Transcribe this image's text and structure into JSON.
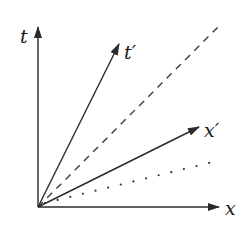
{
  "diagram": {
    "title": "",
    "type": "spacetime-diagram",
    "colors": {
      "line": "#2a2a2a",
      "background": "#ffffff"
    },
    "origin": {
      "x": 38,
      "y": 207
    },
    "axes": {
      "t": {
        "label": "t",
        "end": {
          "x": 38,
          "y": 27
        }
      },
      "x": {
        "label": "x",
        "end": {
          "x": 218,
          "y": 207
        }
      }
    },
    "primed_axes": {
      "t_prime": {
        "label": "t′",
        "end": {
          "x": 119,
          "y": 44
        }
      },
      "x_prime": {
        "label": "x′",
        "end": {
          "x": 199,
          "y": 127
        }
      }
    },
    "reference_lines": {
      "dashed": {
        "style": "dashed",
        "end": {
          "x": 218,
          "y": 27
        }
      },
      "dotted": {
        "style": "dotted",
        "end": {
          "x": 213,
          "y": 162
        }
      }
    }
  }
}
